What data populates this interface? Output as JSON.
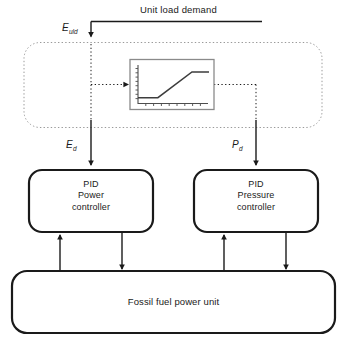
{
  "diagram": {
    "title": "Unit load demand",
    "signals": {
      "uld_base": "E",
      "uld_sub": "uld",
      "power_demand_base": "E",
      "power_demand_sub": "d",
      "pressure_demand_base": "P",
      "pressure_demand_sub": "d"
    },
    "blocks": {
      "setpoint_container": "",
      "power_controller": {
        "line1": "PID",
        "line2": "Power",
        "line3": "controller"
      },
      "pressure_controller": {
        "line1": "PID",
        "line2": "Pressure",
        "line3": "controller"
      },
      "plant": "Fossil fuel power unit"
    },
    "colors": {
      "line": "#1a1a1a",
      "dashed": "#8c8c8c",
      "plot_border": "#808080",
      "plot_curve": "#4d4d4d",
      "background": "#ffffff"
    }
  },
  "chart_data": {
    "type": "line",
    "title": "",
    "xlabel": "",
    "ylabel": "",
    "x": [
      0,
      28,
      76,
      100
    ],
    "y": [
      15,
      15,
      82,
      82
    ],
    "xlim": [
      0,
      100
    ],
    "ylim": [
      0,
      100
    ],
    "grid": false,
    "legend": null,
    "axis_ticks": {
      "y_tick_count": 9,
      "x_tick_count": 9
    }
  }
}
